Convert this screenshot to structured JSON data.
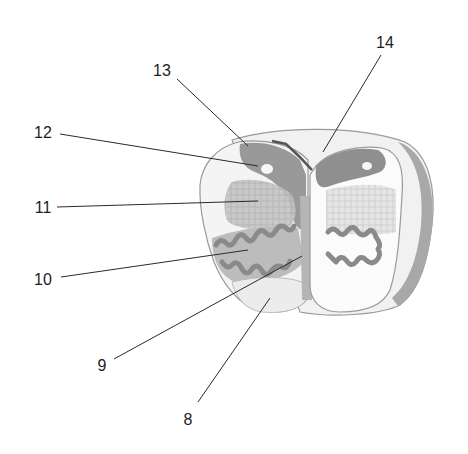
{
  "diagram": {
    "colors": {
      "outline": "#8a8a8a",
      "dark_gray": "#8f8f8f",
      "mid_gray": "#a9a9a9",
      "light_gray": "#d2d2d2",
      "pale": "#ececec",
      "leader_line": "#2a2a2a",
      "label_text": "#1e1e1e"
    },
    "labels": [
      {
        "id": "8",
        "text": "8",
        "x": 188,
        "y": 420
      },
      {
        "id": "9",
        "text": "9",
        "x": 102,
        "y": 366
      },
      {
        "id": "10",
        "text": "10",
        "x": 43,
        "y": 280
      },
      {
        "id": "11",
        "text": "11",
        "x": 43,
        "y": 208
      },
      {
        "id": "12",
        "text": "12",
        "x": 43,
        "y": 133
      },
      {
        "id": "13",
        "text": "13",
        "x": 162,
        "y": 71
      },
      {
        "id": "14",
        "text": "14",
        "x": 385,
        "y": 43
      }
    ]
  }
}
